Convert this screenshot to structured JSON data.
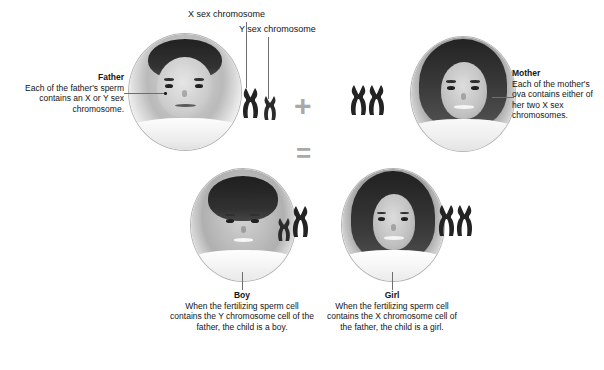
{
  "diagram": {
    "title_hidden": "Sex determination by X and Y chromosomes",
    "background": "#ffffff",
    "ink": "#141414",
    "line_color": "#6e6e6e",
    "operator_color": "#a9a9a9"
  },
  "labels": {
    "x_chromosome": "X sex chromosome",
    "y_chromosome": "Y sex chromosome"
  },
  "operators": {
    "plus": "+",
    "equals": "="
  },
  "parents": [
    {
      "key": "father",
      "title": "Father",
      "body": "Each of the father's sperm contains an X or Y sex chromosome.",
      "body_lines": [
        "Each of the father's",
        "sperm contains an X",
        "or Y sex chromosome."
      ],
      "chromosomes": [
        "X",
        "Y"
      ]
    },
    {
      "key": "mother",
      "title": "Mother",
      "body": "Each of the mother's ova contains either of her two X sex chromosomes.",
      "body_lines": [
        "Each of the mother's",
        "ova contains either",
        "of her two X sex",
        "chromosomes."
      ],
      "chromosomes": [
        "X",
        "X"
      ]
    }
  ],
  "children": [
    {
      "key": "boy",
      "title": "Boy",
      "body": "When the fertilizing sperm cell contains the Y chromosome cell of the father, the child is a boy.",
      "body_lines": [
        "When the fertilizing",
        "sperm cell contains the Y",
        "chromosome cell of the",
        "father, the child is",
        "a boy."
      ],
      "chromosomes": [
        "Y",
        "X"
      ]
    },
    {
      "key": "girl",
      "title": "Girl",
      "body": "When the fertilizing sperm cell contains the X chromosome cell of the father, the child is a girl.",
      "body_lines": [
        "When the fertilizing",
        "sperm cell contains the X",
        "chromosome cell of the",
        "father, the child is",
        "a girl."
      ],
      "chromosomes": [
        "X",
        "X"
      ]
    }
  ]
}
